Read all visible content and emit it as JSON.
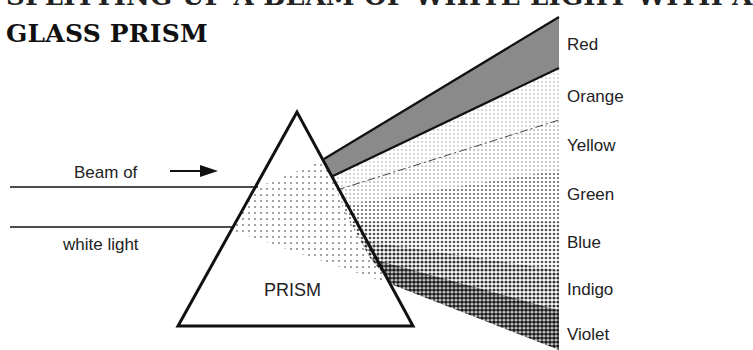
{
  "title": {
    "line1": "SPLITTING UP A BEAM OF WHITE LIGHT WITH A",
    "line2": "GLASS PRISM"
  },
  "beam": {
    "label_top": "Beam of",
    "label_bottom": "white light",
    "arrow": "arrow-right"
  },
  "prism": {
    "label": "PRISM"
  },
  "spectrum": {
    "bands": [
      {
        "name": "Red",
        "shade": "#8a8a8a"
      },
      {
        "name": "Orange",
        "shade": "#eeeeee"
      },
      {
        "name": "Yellow",
        "shade": "#e6e6e6"
      },
      {
        "name": "Green",
        "shade": "#cfcfcf"
      },
      {
        "name": "Blue",
        "shade": "#b2b2b2"
      },
      {
        "name": "Indigo",
        "shade": "#8c8c8c"
      },
      {
        "name": "Violet",
        "shade": "#5e5e5e"
      }
    ]
  }
}
